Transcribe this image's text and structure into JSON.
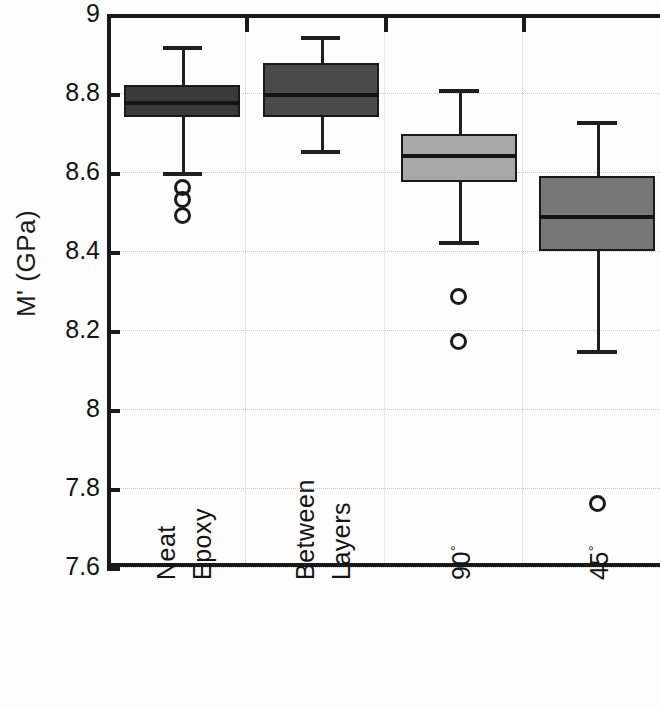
{
  "chart_data": {
    "type": "box",
    "title": "",
    "xlabel": "",
    "ylabel": "M' (GPa)",
    "ylim": [
      7.6,
      9
    ],
    "ytick_labels": [
      "9",
      "8.8",
      "8.6",
      "8.4",
      "8.2",
      "8",
      "7.8",
      "7.6"
    ],
    "ytick_values": [
      9,
      8.8,
      8.6,
      8.4,
      8.2,
      8,
      7.8,
      7.6
    ],
    "grid": "horizontal dotted gridlines and vertical dotted category dividers",
    "legend": "none",
    "categories": [
      "Neat Epoxy",
      "Between Layers",
      "90°",
      "45°"
    ],
    "boxes": [
      {
        "category": "Neat Epoxy",
        "label_line1": "Neat",
        "label_line2": "Epoxy",
        "whisker_low": 8.6,
        "q1": 8.74,
        "median": 8.78,
        "q3": 8.82,
        "whisker_high": 8.92,
        "outliers": [
          8.56,
          8.53,
          8.49
        ],
        "fill": "#3a3a3a"
      },
      {
        "category": "Between Layers",
        "label_line1": "Between",
        "label_line2": "Layers",
        "whisker_low": 8.655,
        "q1": 8.74,
        "median": 8.8,
        "q3": 8.875,
        "whisker_high": 8.945,
        "outliers": [],
        "fill": "#4a4a4a"
      },
      {
        "category": "90°",
        "label_line1": "90°",
        "label_line2": "",
        "whisker_low": 8.425,
        "q1": 8.575,
        "median": 8.645,
        "q3": 8.695,
        "whisker_high": 8.81,
        "outliers": [
          8.285,
          8.17
        ],
        "fill": "#a8a8a8"
      },
      {
        "category": "45°",
        "label_line1": "45°",
        "label_line2": "",
        "whisker_low": 8.15,
        "q1": 8.4,
        "median": 8.49,
        "q3": 8.59,
        "whisker_high": 8.73,
        "outliers": [
          7.76
        ],
        "fill": "#777777"
      }
    ],
    "colors": {
      "axis": "#1a1a1a",
      "gridline": "#c9c9c9",
      "text": "#141414",
      "background": "#ffffff"
    }
  }
}
